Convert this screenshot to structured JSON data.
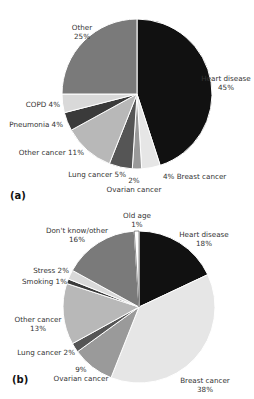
{
  "chart_data": [
    {
      "type": "pie",
      "panel_label": "(a)",
      "start_angle_deg": 0,
      "direction": "clockwise",
      "center": [
        137,
        94
      ],
      "radius": 75,
      "slices": [
        {
          "name": "Heart disease",
          "value": 45,
          "label": "Heart disease",
          "pct": "45%",
          "color": "#111111",
          "lx": 226,
          "ly": 81,
          "anchor": "middle",
          "two_line": true
        },
        {
          "name": "Breast cancer",
          "value": 4,
          "label": "Breast cancer",
          "pct": "4%",
          "color": "#e6e6e6",
          "lx": 163,
          "ly": 179,
          "anchor": "start",
          "two_line": false,
          "pct_first": true
        },
        {
          "name": "Ovarian cancer",
          "value": 2,
          "label": "Ovarian cancer",
          "pct": "2%",
          "color": "#9a9a9a",
          "lx": 134,
          "ly": 183,
          "anchor": "middle",
          "two_line": true,
          "pct_first": true
        },
        {
          "name": "Lung cancer",
          "value": 5,
          "label": "Lung cancer",
          "pct": "5%",
          "color": "#555555",
          "lx": 126,
          "ly": 177,
          "anchor": "end",
          "two_line": false
        },
        {
          "name": "Other cancer",
          "value": 11,
          "label": "Other cancer",
          "pct": "11%",
          "color": "#b8b8b8",
          "lx": 84,
          "ly": 155,
          "anchor": "end",
          "two_line": false
        },
        {
          "name": "Pneumonia",
          "value": 4,
          "label": "Pneumonia",
          "pct": "4%",
          "color": "#3a3a3a",
          "lx": 63,
          "ly": 127,
          "anchor": "end",
          "two_line": false
        },
        {
          "name": "COPD",
          "value": 4,
          "label": "COPD",
          "pct": "4%",
          "color": "#d9d9d9",
          "lx": 60,
          "ly": 107,
          "anchor": "end",
          "two_line": false
        },
        {
          "name": "Other",
          "value": 25,
          "label": "Other",
          "pct": "25%",
          "color": "#7a7a7a",
          "lx": 82,
          "ly": 30,
          "anchor": "middle",
          "two_line": true
        }
      ]
    },
    {
      "type": "pie",
      "panel_label": "(b)",
      "start_angle_deg": 0,
      "direction": "clockwise",
      "center": [
        139,
        307
      ],
      "radius": 76,
      "slices": [
        {
          "name": "Heart disease",
          "value": 18,
          "label": "Heart disease",
          "pct": "18%",
          "color": "#111111",
          "lx": 204,
          "ly": 237,
          "anchor": "middle",
          "two_line": true
        },
        {
          "name": "Breast cancer",
          "value": 38,
          "label": "Breast cancer",
          "pct": "38%",
          "color": "#e6e6e6",
          "lx": 205,
          "ly": 383,
          "anchor": "middle",
          "two_line": true
        },
        {
          "name": "Ovarian cancer",
          "value": 9,
          "label": "Ovarian cancer",
          "pct": "9%",
          "color": "#9a9a9a",
          "lx": 81,
          "ly": 372,
          "anchor": "middle",
          "two_line": true,
          "pct_first": true
        },
        {
          "name": "Lung cancer",
          "value": 2,
          "label": "Lung cancer",
          "pct": "2%",
          "color": "#555555",
          "lx": 75,
          "ly": 355,
          "anchor": "end",
          "two_line": false
        },
        {
          "name": "Other cancer",
          "value": 13,
          "label": "Other cancer",
          "pct": "13%",
          "color": "#b8b8b8",
          "lx": 38,
          "ly": 322,
          "anchor": "middle",
          "two_line": true
        },
        {
          "name": "Smoking",
          "value": 1,
          "label": "Smoking",
          "pct": "1%",
          "color": "#3a3a3a",
          "lx": 67,
          "ly": 284,
          "anchor": "end",
          "two_line": false
        },
        {
          "name": "Stress",
          "value": 2,
          "label": "Stress",
          "pct": "2%",
          "color": "#d9d9d9",
          "lx": 69,
          "ly": 273,
          "anchor": "end",
          "two_line": false
        },
        {
          "name": "Don't know/other",
          "value": 16,
          "label": "Don't know/other",
          "pct": "16%",
          "color": "#7a7a7a",
          "lx": 77,
          "ly": 233,
          "anchor": "middle",
          "two_line": true
        },
        {
          "name": "Old age",
          "value": 1,
          "label": "Old age",
          "pct": "1%",
          "color": "#ffffff",
          "lx": 137,
          "ly": 218,
          "anchor": "middle",
          "two_line": true
        }
      ]
    }
  ]
}
